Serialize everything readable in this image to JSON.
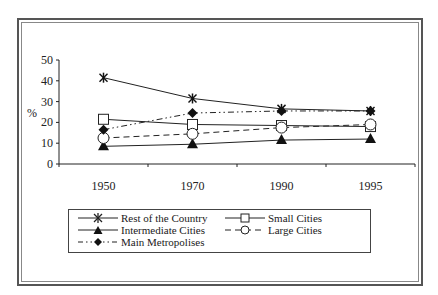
{
  "chart_data": {
    "type": "line",
    "title": "",
    "xlabel": "",
    "ylabel": "%",
    "ylim": [
      0,
      50
    ],
    "yticks": [
      0,
      10,
      20,
      30,
      40,
      50
    ],
    "categories": [
      "1950",
      "1970",
      "1990",
      "1995"
    ],
    "grid": false,
    "legend_position": "bottom",
    "series": [
      {
        "name": "Rest of the Country",
        "values": [
          41.5,
          31.5,
          26.5,
          25.5
        ],
        "marker": "asterisk",
        "line": "solid"
      },
      {
        "name": "Small Cities",
        "values": [
          21.5,
          19,
          18.5,
          18
        ],
        "marker": "square-open",
        "line": "solid"
      },
      {
        "name": "Intermediate Cities",
        "values": [
          8.5,
          9.5,
          11.5,
          12
        ],
        "marker": "triangle-filled",
        "line": "solid"
      },
      {
        "name": "Large Cities",
        "values": [
          12.5,
          14.5,
          17.5,
          19
        ],
        "marker": "circle-open",
        "line": "dashed"
      },
      {
        "name": "Main Metropolises",
        "values": [
          16.5,
          24.5,
          25.5,
          25.5
        ],
        "marker": "diamond-filled",
        "line": "dash-dot-dot"
      }
    ]
  },
  "legend": {
    "items": [
      {
        "label": "Rest of the Country"
      },
      {
        "label": "Small Cities"
      },
      {
        "label": "Intermediate Cities"
      },
      {
        "label": "Large Cities"
      },
      {
        "label": "Main Metropolises"
      }
    ]
  }
}
